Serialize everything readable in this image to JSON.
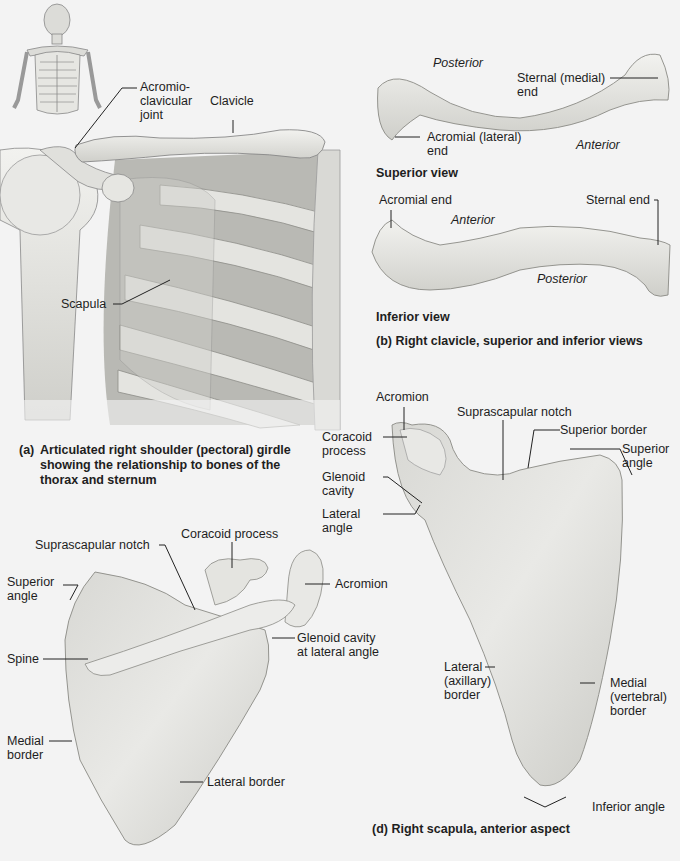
{
  "panel_a": {
    "labels": {
      "acromioclavicular_joint": "Acromio-\nclavicular\njoint",
      "clavicle": "Clavicle",
      "scapula": "Scapula"
    },
    "caption_letter": "(a)",
    "caption": "Articulated right shoulder (pectoral) girdle\nshowing the relationship to bones of the\nthorax and sternum"
  },
  "panel_b": {
    "superior": {
      "posterior": "Posterior",
      "anterior": "Anterior",
      "sternal_end": "Sternal (medial)\nend",
      "acromial_end": "Acromial (lateral)\nend",
      "view_label": "Superior view"
    },
    "inferior": {
      "acromial_end": "Acromial end",
      "sternal_end": "Sternal end",
      "anterior": "Anterior",
      "posterior": "Posterior",
      "view_label": "Inferior view"
    },
    "caption": "(b) Right clavicle, superior and inferior views"
  },
  "panel_c": {
    "labels": {
      "suprascapular_notch": "Suprascapular notch",
      "coracoid_process": "Coracoid process",
      "superior_angle": "Superior\nangle",
      "acromion": "Acromion",
      "glenoid_cavity": "Glenoid cavity\nat lateral angle",
      "spine": "Spine",
      "medial_border": "Medial\nborder",
      "lateral_border": "Lateral border"
    }
  },
  "panel_d": {
    "labels": {
      "acromion": "Acromion",
      "suprascapular_notch": "Suprascapular notch",
      "coracoid_process": "Coracoid\nprocess",
      "superior_border": "Superior border",
      "superior_angle": "Superior\nangle",
      "glenoid_cavity": "Glenoid\ncavity",
      "lateral_angle": "Lateral\nangle",
      "lateral_border": "Lateral\n(axillary)\nborder",
      "medial_border": "Medial\n(vertebral)\nborder",
      "inferior_angle": "Inferior angle"
    },
    "caption": "(d) Right scapula, anterior aspect"
  },
  "colors": {
    "background": "#f3f3f3",
    "bone": "#e6e6e3",
    "bone_shade": "#bdbdb8",
    "rib_dark": "#8f8f8a",
    "text": "#1e1e1e"
  }
}
